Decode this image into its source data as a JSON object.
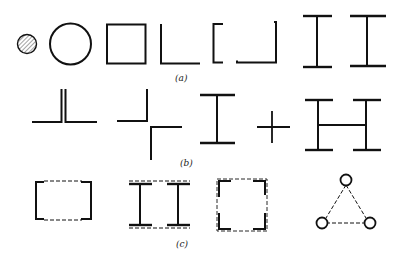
{
  "figure": {
    "rows": [
      {
        "label": "(a)",
        "description": "Cross-section shapes",
        "items": [
          "solid-round-bar",
          "hollow-circular-tube",
          "square-tube",
          "angle-section",
          "built-up-channel-section",
          "i-beam-1",
          "i-beam-2"
        ]
      },
      {
        "label": "(b)",
        "description": "Built-up sections from components",
        "items": [
          "double-angle-tee",
          "angle-pair-offset",
          "i-section",
          "plus-sign",
          "h-built-up-section"
        ]
      },
      {
        "label": "(c)",
        "description": "Laced / battened compound sections",
        "items": [
          "laced-channel-pair",
          "laced-twin-i-beams",
          "laced-four-angles",
          "triangular-laced-tubes"
        ]
      }
    ],
    "colors": {
      "line": "#111111",
      "background": "#ffffff",
      "hatch": "#555555"
    }
  }
}
